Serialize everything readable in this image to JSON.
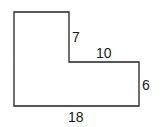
{
  "diagram": {
    "type": "L-shaped polygon",
    "stroke_color": "#222222",
    "background": "#ffffff",
    "labels": {
      "notch_height": "7",
      "notch_width": "10",
      "right_side": "6",
      "bottom": "18"
    }
  }
}
